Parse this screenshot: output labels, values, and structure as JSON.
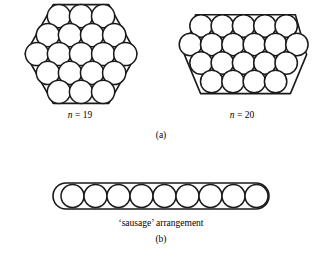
{
  "figure": {
    "background_color": "#ffffff",
    "ink_color": "#1a1a1a",
    "panels": [
      {
        "id": "a",
        "caption": "(a)",
        "items": [
          {
            "id": "hex19",
            "label_prefix": "n",
            "label_equals": " = ",
            "label_value": "19",
            "label_full": "n = 19",
            "container_shape": "hexagon",
            "circle_count": 19,
            "rows": [
              3,
              4,
              5,
              4,
              3
            ],
            "circle_radius": 11.6,
            "description": "Nineteen equal circles packed in a regular hexagon"
          },
          {
            "id": "hex20",
            "label_prefix": "n",
            "label_equals": " = ",
            "label_value": "20",
            "label_full": "n = 20",
            "container_shape": "irregular-hexagon",
            "circle_count": 20,
            "rows": [
              5,
              6,
              5,
              4
            ],
            "circle_radius": 11.2,
            "description": "Twenty equal circles packed in an irregular hexagonal outline"
          }
        ]
      },
      {
        "id": "b",
        "caption": "(b)",
        "items": [
          {
            "id": "sausage",
            "label_full": "‘sausage’ arrangement",
            "container_shape": "stadium",
            "circle_count": 9,
            "rows": [
              9
            ],
            "circle_radius": 11.5,
            "description": "Nine equal circles in a single row inside a stadium outline"
          }
        ]
      }
    ]
  }
}
